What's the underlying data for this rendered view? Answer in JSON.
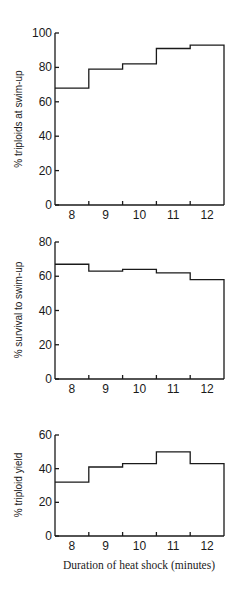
{
  "figure": {
    "xlabel": "Duration of heat shock (minutes)"
  },
  "chart_data": [
    {
      "type": "bar",
      "style": "step-histogram",
      "title": "",
      "categories": [
        "8",
        "9",
        "10",
        "11",
        "12"
      ],
      "values": [
        68,
        79,
        82,
        91,
        93
      ],
      "xlabel": "",
      "ylabel": "% triploids at swim-up",
      "ylim": [
        0,
        100
      ],
      "yticks": [
        0,
        20,
        40,
        60,
        80,
        100
      ],
      "grid": false
    },
    {
      "type": "bar",
      "style": "step-histogram",
      "title": "",
      "categories": [
        "8",
        "9",
        "10",
        "11",
        "12"
      ],
      "values": [
        67,
        63,
        64,
        62,
        58
      ],
      "xlabel": "",
      "ylabel": "% survival to swim-up",
      "ylim": [
        0,
        80
      ],
      "yticks": [
        0,
        20,
        40,
        60,
        80
      ],
      "grid": false
    },
    {
      "type": "bar",
      "style": "step-histogram",
      "title": "",
      "categories": [
        "8",
        "9",
        "10",
        "11",
        "12"
      ],
      "values": [
        32,
        41,
        43,
        50,
        43
      ],
      "xlabel": "Duration of heat shock (minutes)",
      "ylabel": "% triploid yield",
      "ylim": [
        0,
        60
      ],
      "yticks": [
        0,
        20,
        40,
        60
      ],
      "grid": false
    }
  ]
}
